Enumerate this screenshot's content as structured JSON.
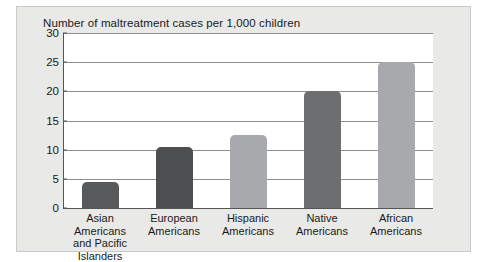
{
  "chart_data": {
    "type": "bar",
    "title": "Number of maltreatment cases per 1,000 children",
    "xlabel": "",
    "ylabel": "",
    "ylim": [
      0,
      30
    ],
    "ytick_step": 5,
    "yticks": [
      "30",
      "25",
      "20",
      "15",
      "10",
      "5",
      "0"
    ],
    "grid": true,
    "legend": "none",
    "categories": [
      "Asian Americans and Pacific Islanders",
      "European Americans",
      "Hispanic Americans",
      "Native Americans",
      "African Americans"
    ],
    "category_lines": [
      [
        "Asian Americans",
        "and Pacific",
        "Islanders"
      ],
      [
        "European",
        "Americans"
      ],
      [
        "Hispanic",
        "Americans"
      ],
      [
        "Native",
        "Americans"
      ],
      [
        "African",
        "Americans"
      ]
    ],
    "values": [
      4.5,
      10.5,
      12.5,
      20,
      25
    ],
    "bar_colors": [
      "#58595b",
      "#4d4e50",
      "#a7a9ac",
      "#6d6e70",
      "#a7a9ac"
    ]
  },
  "colors": {
    "panel_background": "#e9e9e7",
    "panel_border": "#c9c9c5",
    "plot_background": "#ffffff",
    "gridline": "#8e8e8e",
    "axis": "#555555",
    "text": "#1a1a1a",
    "bar_dark": "#58595b",
    "bar_light": "#a7a9ac"
  }
}
